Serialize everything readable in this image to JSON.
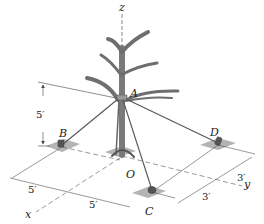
{
  "figure": {
    "type": "3D statics diagram",
    "axes": {
      "x": "x",
      "y": "y",
      "z": "z"
    },
    "points": {
      "A": "A",
      "B": "B",
      "C": "C",
      "D": "D",
      "O": "O"
    },
    "dimensions": {
      "height_A": "5′",
      "x_dim_1": "5′",
      "x_dim_2": "5′",
      "y_dim_1": "3′",
      "y_dim_2": "3′"
    },
    "colors": {
      "line": "#444444",
      "cable": "#555555",
      "ground_patch": "#9a9a9a",
      "trunk": "#8a8a8a"
    }
  }
}
